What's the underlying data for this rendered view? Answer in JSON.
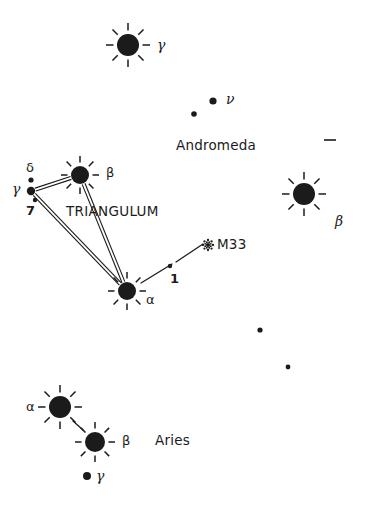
{
  "chart": {
    "type": "star-chart",
    "width": 369,
    "height": 506,
    "background_color": "#ffffff",
    "ink_color": "#1b1b1b"
  },
  "constellation_labels": [
    {
      "id": "triangulum",
      "text": "TRIANGULUM",
      "x": 66,
      "y": 212,
      "style": "caps"
    },
    {
      "id": "andromeda",
      "text": "Andromeda",
      "x": 176,
      "y": 146,
      "style": "mixed"
    },
    {
      "id": "aries",
      "text": "Aries",
      "x": 155,
      "y": 442,
      "style": "mixed"
    }
  ],
  "deep_sky_objects": [
    {
      "id": "m33",
      "name": "M33",
      "symbol": "galaxy-symbol",
      "x": 208,
      "y": 245,
      "label_x": 217,
      "label_y": 245
    }
  ],
  "stars": [
    {
      "id": "gamma-andromedae",
      "label": "γ",
      "label_style": "greek-italic",
      "x": 128,
      "y": 45,
      "radius": 11,
      "glyph": "rayed-star",
      "rays": 8,
      "ray_length": 11,
      "label_x": 157,
      "label_y": 45,
      "label_anchor": "left"
    },
    {
      "id": "beta-trianguli",
      "label": "β",
      "label_style": "greek",
      "x": 80,
      "y": 175,
      "radius": 9,
      "glyph": "rayed-star",
      "rays": 8,
      "ray_length": 10,
      "label_x": 106,
      "label_y": 173,
      "label_anchor": "left"
    },
    {
      "id": "alpha-trianguli",
      "label": "α",
      "label_style": "greek",
      "x": 127,
      "y": 291,
      "radius": 9,
      "glyph": "rayed-star",
      "rays": 8,
      "ray_length": 10,
      "label_x": 146,
      "label_y": 300,
      "label_anchor": "left"
    },
    {
      "id": "beta-andromedae",
      "label": "β",
      "label_style": "greek-italic",
      "x": 304,
      "y": 194,
      "radius": 11,
      "glyph": "rayed-star",
      "rays": 8,
      "ray_length": 11,
      "label_x": 335,
      "label_y": 221,
      "label_anchor": "left"
    },
    {
      "id": "alpha-arietis",
      "label": "α",
      "label_style": "greek",
      "x": 60,
      "y": 407,
      "radius": 11,
      "glyph": "rayed-star",
      "rays": 8,
      "ray_length": 11,
      "label_x": 26,
      "label_y": 407,
      "label_anchor": "left"
    },
    {
      "id": "beta-arietis",
      "label": "β",
      "label_style": "greek",
      "x": 95,
      "y": 442,
      "radius": 10,
      "glyph": "rayed-star",
      "rays": 8,
      "ray_length": 10,
      "label_x": 122,
      "label_y": 441,
      "label_anchor": "left"
    }
  ],
  "point_stars": [
    {
      "id": "delta-trianguli",
      "label": "δ",
      "label_style": "greek",
      "x": 31,
      "y": 180,
      "radius": 2.6,
      "label_x": 26,
      "label_y": 168
    },
    {
      "id": "gamma-trianguli",
      "label": "γ",
      "label_style": "greek-italic",
      "x": 31,
      "y": 191,
      "radius": 4.2,
      "label_x": 12,
      "label_y": 189
    },
    {
      "id": "7-trianguli",
      "label": "7",
      "label_style": "numeral",
      "x": 35,
      "y": 200,
      "radius": 2.2,
      "label_x": 26,
      "label_y": 211
    },
    {
      "id": "nu-andromedae",
      "label": "ν",
      "label_style": "greek-italic",
      "x": 213,
      "y": 101,
      "radius": 3.6,
      "label_x": 226,
      "label_y": 99
    },
    {
      "id": "mu-andromedae",
      "label": "",
      "label_style": "none",
      "x": 194,
      "y": 114,
      "radius": 2.8,
      "label_x": 0,
      "label_y": 0
    },
    {
      "id": "1-trianguli",
      "label": "1",
      "label_style": "numeral",
      "x": 170,
      "y": 266,
      "radius": 2.2,
      "label_x": 170,
      "label_y": 279
    },
    {
      "id": "gamma-arietis",
      "label": "γ",
      "label_style": "greek-italic",
      "x": 87,
      "y": 476,
      "radius": 4.0,
      "label_x": 96,
      "label_y": 476
    },
    {
      "id": "field-star-1",
      "label": "",
      "label_style": "none",
      "x": 260,
      "y": 330,
      "radius": 2.6,
      "label_x": 0,
      "label_y": 0
    },
    {
      "id": "field-star-2",
      "label": "",
      "label_style": "none",
      "x": 288,
      "y": 367,
      "radius": 2.4,
      "label_x": 0,
      "label_y": 0
    }
  ],
  "tick_marks": [
    {
      "id": "grid-tick-right",
      "x1": 324,
      "y1": 140,
      "x2": 336,
      "y2": 140
    }
  ],
  "constellation_lines": [
    {
      "id": "line-beta-gamma-tri",
      "from": "beta-trianguli",
      "to": "gamma-trianguli",
      "style": "double"
    },
    {
      "id": "line-gamma-alpha-tri",
      "from": "gamma-trianguli",
      "to": "alpha-trianguli",
      "style": "double"
    },
    {
      "id": "line-alpha-beta-tri",
      "from": "alpha-trianguli",
      "to": "beta-trianguli",
      "style": "double"
    }
  ],
  "pointer_lines": [
    {
      "id": "pointer-alpha-to-m33",
      "x1": 141,
      "y1": 283,
      "x2": 172,
      "y2": 264,
      "style": "single"
    },
    {
      "id": "pointer-1-to-m33",
      "x1": 176,
      "y1": 262,
      "x2": 203,
      "y2": 244,
      "style": "single"
    }
  ],
  "aries_link_lines": [
    {
      "id": "link-alpha-beta-ari",
      "x1": 73,
      "y1": 421,
      "x2": 83,
      "y2": 430,
      "style": "single"
    }
  ]
}
